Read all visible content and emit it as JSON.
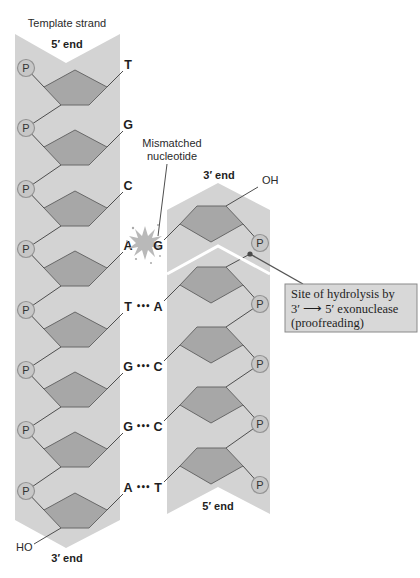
{
  "template_strand": {
    "label": "Template strand",
    "top_end": "5′ end",
    "bottom_end": "3′ end",
    "terminal_group": "HO",
    "phosphate": "P",
    "bases": [
      "T",
      "G",
      "C",
      "A",
      "T",
      "G",
      "G",
      "A"
    ]
  },
  "new_strand": {
    "top_end": "3′ end",
    "terminal_group": "OH",
    "bottom_end": "5′ end",
    "phosphate": "P",
    "bases": [
      "G",
      "A",
      "C",
      "C",
      "T"
    ]
  },
  "base_pairs": [
    {
      "template": "A",
      "new": "G",
      "bond": "",
      "mismatched": true
    },
    {
      "template": "T",
      "new": "A",
      "bond": "•••"
    },
    {
      "template": "G",
      "new": "C",
      "bond": "•••"
    },
    {
      "template": "G",
      "new": "C",
      "bond": "•••"
    },
    {
      "template": "A",
      "new": "T",
      "bond": "•••"
    }
  ],
  "annotations": {
    "mismatch": {
      "lines": [
        "Mismatched",
        "nucleotide"
      ]
    },
    "hydrolysis": {
      "lines": [
        "Site of hydrolysis by",
        "3′ ⟶ 5′ exonuclease",
        "(proofreading)"
      ]
    }
  },
  "colors": {
    "backbone_band": "#d3d3d3",
    "sugar_fill": "#a7a7a7",
    "sugar_stroke": "#686868",
    "phosphate_fill": "#c7c7c7",
    "callout_fill": "#d8d8d8",
    "background": "#ffffff"
  }
}
